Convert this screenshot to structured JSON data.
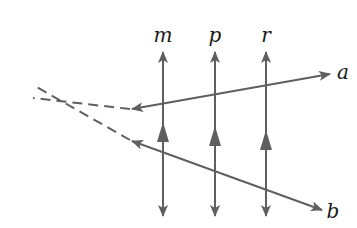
{
  "diagram": {
    "title": "",
    "line_color": "#5f5f5f",
    "label_color": "#1a1a1a",
    "vertical_lines": [
      {
        "label": "m",
        "x": 163,
        "y_top": 52,
        "y_bottom": 216,
        "mid_arrow_y": 120
      },
      {
        "label": "p",
        "x": 215,
        "y_top": 52,
        "y_bottom": 216,
        "mid_arrow_y": 128
      },
      {
        "label": "r",
        "x": 266,
        "y_top": 52,
        "y_bottom": 216,
        "mid_arrow_y": 134
      }
    ],
    "transversals": [
      {
        "label": "a",
        "solid_from": [
          140,
          108
        ],
        "solid_to": [
          330,
          74
        ],
        "dashed_to": [
          33,
          98
        ],
        "arrow_end": "both"
      },
      {
        "label": "b",
        "solid_from": [
          138,
          143
        ],
        "solid_to": [
          322,
          210
        ],
        "dashed_to": [
          33,
          85
        ],
        "arrow_end": "both"
      }
    ],
    "labels": {
      "m": "m",
      "p": "p",
      "r": "r",
      "a": "a",
      "b": "b"
    },
    "intersection_point": [
      68,
      91
    ]
  }
}
